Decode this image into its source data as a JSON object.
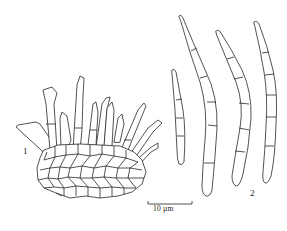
{
  "figure": {
    "labels": {
      "panel_1": "1",
      "panel_2": "2"
    },
    "scale_bar": {
      "label": "10 µm",
      "length_px": 44
    },
    "panels": [
      {
        "id": "1",
        "depicts": "stroma with fascicle of conidiophores"
      },
      {
        "id": "2",
        "depicts": "four septate conidia"
      }
    ],
    "colors": {
      "line": "#1a1a1a",
      "background": "#ffffff"
    }
  }
}
